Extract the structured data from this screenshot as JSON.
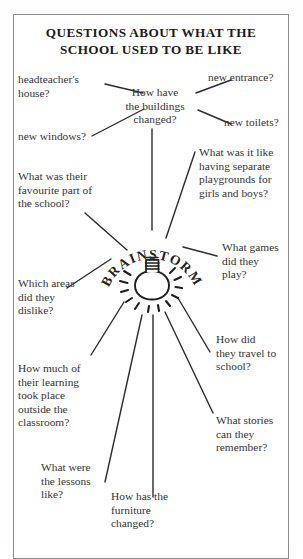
{
  "page": {
    "title_line_1": "QUESTIONS ABOUT WHAT THE",
    "title_line_2": "SCHOOL USED TO BE LIKE",
    "border_color": "#8d8d8d",
    "ink_color": "#333333",
    "background_color": "#ffffff"
  },
  "center": {
    "word": "BRAINSTORM",
    "icon": "lightbulb-icon",
    "letters": [
      "B",
      "R",
      "A",
      "I",
      "N",
      "S",
      "T",
      "O",
      "R",
      "M"
    ]
  },
  "branches": [
    {
      "id": "headteachers-house",
      "text": "headteacher's\nhouse?"
    },
    {
      "id": "buildings-changed",
      "text": "How have\nthe buildings\nchanged?"
    },
    {
      "id": "new-entrance",
      "text": "new entrance?"
    },
    {
      "id": "new-toilets",
      "text": "new toilets?"
    },
    {
      "id": "new-windows",
      "text": "new windows?"
    },
    {
      "id": "favourite-part",
      "text": "What was their\nfavourite part of\nthe school?"
    },
    {
      "id": "separate-playgrounds",
      "text": "What was it like\nhaving separate\nplaygrounds for\ngirls and boys?"
    },
    {
      "id": "what-games",
      "text": "What games\ndid they\nplay?"
    },
    {
      "id": "which-areas-dislike",
      "text": "Which areas\ndid they\ndislike?"
    },
    {
      "id": "how-did-travel",
      "text": "How did\nthey travel to\nschool?"
    },
    {
      "id": "learning-outside",
      "text": "How much of\ntheir learning\ntook place\noutside the\nclassroom?"
    },
    {
      "id": "what-stories",
      "text": "What stories\ncan they\nremember?"
    },
    {
      "id": "what-lessons-like",
      "text": "What were\nthe lessons\nlike?"
    },
    {
      "id": "furniture-changed",
      "text": "How has the\nfurniture\nchanged?"
    }
  ]
}
